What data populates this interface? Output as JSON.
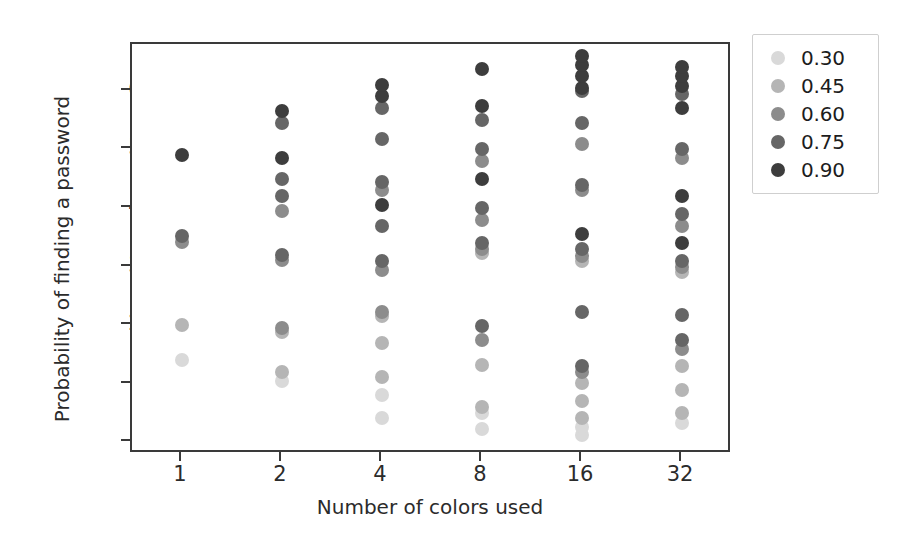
{
  "chart_data": {
    "type": "scatter",
    "title": "",
    "xlabel": "Number of colors used",
    "ylabel": "Probability of finding a password",
    "categories": [
      "1",
      "2",
      "4",
      "8",
      "16",
      "32"
    ],
    "xticklabels": [
      "1",
      "2",
      "4",
      "8",
      "16",
      "32"
    ],
    "yticklabels": [
      "0%",
      "10%",
      "20%",
      "30%",
      "40%",
      "50%",
      "60%"
    ],
    "ytickvalues": [
      0,
      10,
      20,
      30,
      40,
      50,
      60
    ],
    "ylim": [
      -2,
      68
    ],
    "yunit": "%",
    "grid": false,
    "legend": {
      "title": "",
      "position": "right-outside",
      "entries": [
        {
          "label": "0.30",
          "color": "#d9d9d9"
        },
        {
          "label": "0.45",
          "color": "#b5b5b5"
        },
        {
          "label": "0.60",
          "color": "#8c8c8c"
        },
        {
          "label": "0.75",
          "color": "#666666"
        },
        {
          "label": "0.90",
          "color": "#3d3d3d"
        }
      ]
    },
    "series": [
      {
        "name": "0.30",
        "color": "#d9d9d9",
        "points": [
          {
            "x": "1",
            "y": 14.0
          },
          {
            "x": "2",
            "y": 10.5
          },
          {
            "x": "4",
            "y": 4.2
          },
          {
            "x": "4",
            "y": 8.0
          },
          {
            "x": "8",
            "y": 2.3
          },
          {
            "x": "8",
            "y": 5.0
          },
          {
            "x": "16",
            "y": 1.2
          },
          {
            "x": "16",
            "y": 2.6
          },
          {
            "x": "32",
            "y": 3.3
          }
        ]
      },
      {
        "name": "0.45",
        "color": "#b5b5b5",
        "points": [
          {
            "x": "1",
            "y": 20.0
          },
          {
            "x": "2",
            "y": 12.0
          },
          {
            "x": "2",
            "y": 18.8
          },
          {
            "x": "4",
            "y": 11.2
          },
          {
            "x": "4",
            "y": 17.0
          },
          {
            "x": "4",
            "y": 21.5
          },
          {
            "x": "8",
            "y": 6.0
          },
          {
            "x": "8",
            "y": 13.2
          },
          {
            "x": "8",
            "y": 32.3
          },
          {
            "x": "16",
            "y": 4.2
          },
          {
            "x": "16",
            "y": 7.0
          },
          {
            "x": "16",
            "y": 10.2
          },
          {
            "x": "16",
            "y": 31.0
          },
          {
            "x": "32",
            "y": 5.0
          },
          {
            "x": "32",
            "y": 9.0
          },
          {
            "x": "32",
            "y": 13.0
          },
          {
            "x": "32",
            "y": 29.0
          }
        ]
      },
      {
        "name": "0.60",
        "color": "#8c8c8c",
        "points": [
          {
            "x": "1",
            "y": 34.2
          },
          {
            "x": "2",
            "y": 19.5
          },
          {
            "x": "2",
            "y": 31.2
          },
          {
            "x": "2",
            "y": 39.5
          },
          {
            "x": "4",
            "y": 22.2
          },
          {
            "x": "4",
            "y": 29.5
          },
          {
            "x": "4",
            "y": 43.0
          },
          {
            "x": "8",
            "y": 17.5
          },
          {
            "x": "8",
            "y": 33.0
          },
          {
            "x": "8",
            "y": 38.0
          },
          {
            "x": "8",
            "y": 48.0
          },
          {
            "x": "16",
            "y": 12.0
          },
          {
            "x": "16",
            "y": 31.8
          },
          {
            "x": "16",
            "y": 43.0
          },
          {
            "x": "16",
            "y": 51.0
          },
          {
            "x": "32",
            "y": 16.0
          },
          {
            "x": "32",
            "y": 30.0
          },
          {
            "x": "32",
            "y": 37.0
          },
          {
            "x": "32",
            "y": 48.5
          }
        ]
      },
      {
        "name": "0.75",
        "color": "#666666",
        "points": [
          {
            "x": "1",
            "y": 35.2
          },
          {
            "x": "2",
            "y": 32.0
          },
          {
            "x": "2",
            "y": 42.0
          },
          {
            "x": "2",
            "y": 45.0
          },
          {
            "x": "2",
            "y": 54.5
          },
          {
            "x": "4",
            "y": 31.0
          },
          {
            "x": "4",
            "y": 37.0
          },
          {
            "x": "4",
            "y": 44.5
          },
          {
            "x": "4",
            "y": 51.8
          },
          {
            "x": "4",
            "y": 57.0
          },
          {
            "x": "8",
            "y": 19.8
          },
          {
            "x": "8",
            "y": 34.0
          },
          {
            "x": "8",
            "y": 40.0
          },
          {
            "x": "8",
            "y": 50.0
          },
          {
            "x": "8",
            "y": 55.0
          },
          {
            "x": "16",
            "y": 13.0
          },
          {
            "x": "16",
            "y": 22.2
          },
          {
            "x": "16",
            "y": 33.0
          },
          {
            "x": "16",
            "y": 44.0
          },
          {
            "x": "16",
            "y": 54.5
          },
          {
            "x": "16",
            "y": 60.0
          },
          {
            "x": "32",
            "y": 17.5
          },
          {
            "x": "32",
            "y": 21.8
          },
          {
            "x": "32",
            "y": 31.0
          },
          {
            "x": "32",
            "y": 39.0
          },
          {
            "x": "32",
            "y": 50.0
          },
          {
            "x": "32",
            "y": 59.5
          }
        ]
      },
      {
        "name": "0.90",
        "color": "#3d3d3d",
        "points": [
          {
            "x": "1",
            "y": 49.0
          },
          {
            "x": "2",
            "y": 48.5
          },
          {
            "x": "2",
            "y": 56.5
          },
          {
            "x": "4",
            "y": 40.5
          },
          {
            "x": "4",
            "y": 59.2
          },
          {
            "x": "4",
            "y": 61.0
          },
          {
            "x": "8",
            "y": 45.0
          },
          {
            "x": "8",
            "y": 57.5
          },
          {
            "x": "8",
            "y": 63.8
          },
          {
            "x": "16",
            "y": 35.5
          },
          {
            "x": "16",
            "y": 60.5
          },
          {
            "x": "16",
            "y": 62.5
          },
          {
            "x": "16",
            "y": 64.5
          },
          {
            "x": "16",
            "y": 66.0
          },
          {
            "x": "32",
            "y": 34.0
          },
          {
            "x": "32",
            "y": 42.0
          },
          {
            "x": "32",
            "y": 57.0
          },
          {
            "x": "32",
            "y": 60.8
          },
          {
            "x": "32",
            "y": 62.5
          },
          {
            "x": "32",
            "y": 64.0
          }
        ]
      }
    ]
  }
}
